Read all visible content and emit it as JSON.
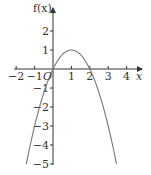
{
  "chart_data": {
    "type": "line",
    "title": "",
    "function": "f(x) = -x^2 + 2x",
    "xlabel": "x",
    "ylabel": "f(x)",
    "origin_label": "O",
    "xlim": [
      -2,
      4
    ],
    "ylim": [
      -5,
      2
    ],
    "x_ticks": [
      -2,
      -1,
      1,
      2,
      3,
      4
    ],
    "x_tick_labels": [
      "−2",
      "−1",
      "1",
      "2",
      "3",
      "4"
    ],
    "y_ticks": [
      2,
      1,
      -1,
      -2,
      -3,
      -4,
      -5
    ],
    "y_tick_labels": [
      "2",
      "1",
      "−1",
      "−2",
      "−3",
      "−4",
      "−5"
    ],
    "grid": false,
    "legend": null,
    "series": [
      {
        "name": "f(x)",
        "x": [
          -1.45,
          -1,
          -0.5,
          0,
          0.5,
          1,
          1.5,
          2,
          2.5,
          3,
          3.45
        ],
        "y": [
          -5.0,
          -3,
          -1.25,
          0,
          0.75,
          1,
          0.75,
          0,
          -1.25,
          -3,
          -5.0
        ]
      }
    ],
    "key_points": {
      "vertex": [
        1,
        1
      ],
      "roots": [
        0,
        2
      ]
    },
    "colors": {
      "axis": "#333333",
      "curve": "#777777"
    }
  }
}
